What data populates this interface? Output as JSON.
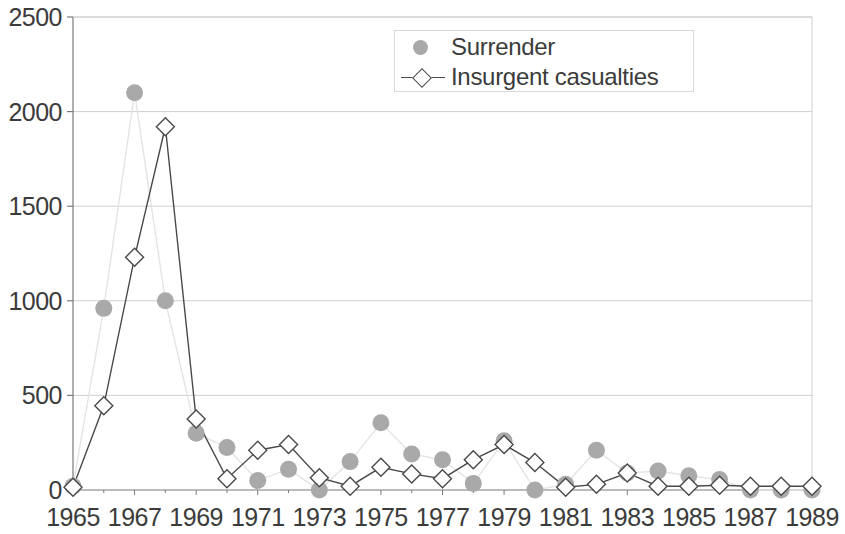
{
  "chart_data": {
    "type": "line",
    "title": "",
    "subtitle": "",
    "xlabel": "",
    "ylabel": "",
    "xlim": [
      1965,
      1989
    ],
    "ylim": [
      0,
      2500
    ],
    "y_ticks": [
      0,
      500,
      1000,
      1500,
      2000,
      2500
    ],
    "y_tick_labels": [
      "0",
      "500",
      "1000",
      "1500",
      "2000",
      "2500"
    ],
    "x": [
      1965,
      1966,
      1967,
      1968,
      1969,
      1970,
      1971,
      1972,
      1973,
      1974,
      1975,
      1976,
      1977,
      1978,
      1979,
      1980,
      1981,
      1982,
      1983,
      1984,
      1985,
      1986,
      1987,
      1988,
      1989
    ],
    "x_tick_values": [
      1965,
      1967,
      1969,
      1971,
      1973,
      1975,
      1977,
      1979,
      1981,
      1983,
      1985,
      1987,
      1989
    ],
    "x_tick_labels": [
      "1965",
      "1967",
      "1969",
      "1971",
      "1973",
      "1975",
      "1977",
      "1979",
      "1981",
      "1983",
      "1985",
      "1987",
      "1989"
    ],
    "grid": true,
    "grid_axis": "y",
    "legend_position": "top-center",
    "series": [
      {
        "name": "Surrender",
        "marker": "circle",
        "marker_color": "#a9a9a9",
        "line_color": "#e2e2e2",
        "line_style": "faint",
        "values": [
          20,
          960,
          2100,
          1000,
          300,
          225,
          50,
          110,
          0,
          150,
          355,
          190,
          160,
          35,
          260,
          0,
          30,
          210,
          90,
          100,
          75,
          55,
          0,
          0,
          0
        ]
      },
      {
        "name": "Insurgent casualties",
        "marker": "diamond",
        "marker_color": "#ffffff",
        "marker_edge_color": "#4a4a4a",
        "line_color": "#4a4a4a",
        "line_style": "solid",
        "values": [
          15,
          445,
          1230,
          1920,
          375,
          60,
          210,
          240,
          65,
          20,
          120,
          85,
          60,
          160,
          240,
          145,
          15,
          30,
          90,
          20,
          20,
          25,
          20,
          20,
          20
        ]
      }
    ]
  },
  "legend": {
    "items": [
      {
        "label": "Surrender",
        "key": "circle-marker"
      },
      {
        "label": "Insurgent casualties",
        "key": "line-diamond-marker"
      }
    ]
  },
  "colors": {
    "axis": "#7a7a7a",
    "grid": "#cfcfcf",
    "text": "#3b3b3b",
    "surrender_marker": "#a9a9a9",
    "surrender_line": "#e4e4e4",
    "insurgent_line": "#4a4a4a",
    "insurgent_marker_fill": "#ffffff"
  }
}
